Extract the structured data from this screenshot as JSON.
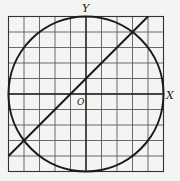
{
  "figure": {
    "labels": {
      "y_axis": "Y",
      "x_axis": "X",
      "origin": "O"
    },
    "grid": {
      "cells": 10,
      "range": [
        -5,
        5
      ]
    },
    "circle": {
      "center": [
        0,
        0
      ],
      "radius": 5,
      "equation": "x^2 + y^2 = 25"
    },
    "line": {
      "equation": "y = x + 1",
      "from": [
        -5,
        -4
      ],
      "to": [
        4,
        5
      ]
    },
    "intersections": [
      [
        3,
        4
      ],
      [
        -4,
        -3
      ]
    ],
    "colors": {
      "ink": "#1a1a1a",
      "grid": "#555555",
      "paper": "#f4f4f2"
    }
  }
}
